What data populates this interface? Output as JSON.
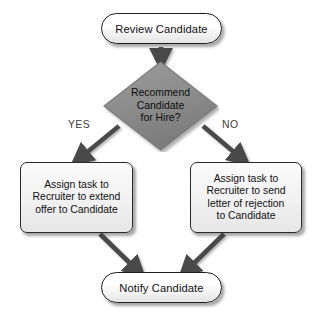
{
  "diagram": {
    "background_color": "#ffffff",
    "nodes": {
      "start": {
        "shape": "stadium",
        "label": "Review Candidate",
        "fill_color": "#f4f4f4",
        "border_color": "#1d1d1d",
        "text_color": "#111111"
      },
      "decision": {
        "shape": "diamond",
        "label_line1": "Recommend",
        "label_line2": "Candidate",
        "label_line3": "for Hire?",
        "fill_color": "#8c8c8c",
        "border_color": "#6e6e6e",
        "text_color": "#0d0d0d"
      },
      "yes_branch": {
        "shape": "process",
        "label_line1": "Assign task to",
        "label_line2": "Recruiter to extend",
        "label_line3": "offer to Candidate",
        "fill_color": "#f0f0f0",
        "border_color": "#2a2a2a",
        "text_color": "#111111"
      },
      "no_branch": {
        "shape": "process",
        "label_line1": "Assign task to",
        "label_line2": "Recruiter to send",
        "label_line3": "letter of rejection",
        "label_line4": "to Candidate",
        "fill_color": "#f0f0f0",
        "border_color": "#2a2a2a",
        "text_color": "#111111"
      },
      "end": {
        "shape": "stadium",
        "label": "Notify Candidate",
        "fill_color": "#f4f4f4",
        "border_color": "#1d1d1d",
        "text_color": "#111111"
      }
    },
    "edges": {
      "start_to_decision": {
        "label": ""
      },
      "decision_to_yes": {
        "label": "YES"
      },
      "decision_to_no": {
        "label": "NO"
      },
      "yes_to_end": {
        "label": ""
      },
      "no_to_end": {
        "label": ""
      },
      "arrow_color": "#4a4a4a",
      "label_color": "#3b3b3b"
    }
  }
}
